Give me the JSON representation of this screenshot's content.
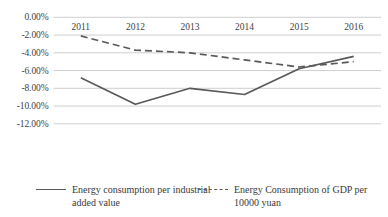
{
  "chart_data": {
    "type": "line",
    "title": "",
    "xlabel": "",
    "ylabel": "",
    "categories": [
      "2011",
      "2012",
      "2013",
      "2014",
      "2015",
      "2016"
    ],
    "ylim": [
      -12.0,
      0.0
    ],
    "ytick_values": [
      0.0,
      -2.0,
      -4.0,
      -6.0,
      -8.0,
      -10.0,
      -12.0
    ],
    "ytick_labels": [
      "0.00%",
      "-2.00%",
      "-4.00%",
      "-6.00%",
      "-8.00%",
      "-10.00%",
      "-12.00%"
    ],
    "grid": true,
    "legend_position": "bottom",
    "series": [
      {
        "name": "Energy consumption per industrial added value",
        "style": "solid",
        "color": "#595959",
        "values": [
          -6.8,
          -9.8,
          -8.0,
          -8.7,
          -5.8,
          -4.4
        ]
      },
      {
        "name": "Energy Consumption of GDP per 10000 yuan",
        "style": "dashed",
        "color": "#595959",
        "values": [
          -2.1,
          -3.7,
          -4.0,
          -4.8,
          -5.6,
          -5.0
        ]
      }
    ]
  },
  "legend": {
    "entries": [
      {
        "label": "Energy consumption per industrial added value",
        "marker": "solid-line-swatch"
      },
      {
        "label": "Energy Consumption of GDP per 10000 yuan",
        "marker": "dashed-line-swatch"
      }
    ]
  }
}
